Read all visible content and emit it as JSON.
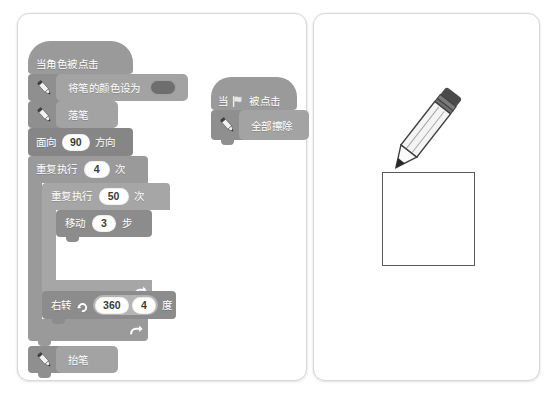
{
  "page": {
    "left_panel_name": "script-canvas-left",
    "right_panel_name": "stage-illustration-right"
  },
  "scripts": {
    "main": {
      "hat": {
        "label": "当角色被点击",
        "name": "when-sprite-clicked"
      },
      "blocks": [
        {
          "name": "set-pen-color-block",
          "label": "将笔的颜色设为",
          "icon": "pen-icon",
          "swatch": "#6e6e6e"
        },
        {
          "name": "pen-down-block",
          "label": "落笔",
          "icon": "pen-icon"
        },
        {
          "name": "point-in-direction-block",
          "label_pre": "面向",
          "value": "90",
          "label_post": "方向"
        },
        {
          "name": "repeat-outer-block",
          "label_pre": "重复执行",
          "value": "4",
          "label_post": "次",
          "loop_icon": "loop-arrow-icon"
        },
        {
          "name": "repeat-inner-block",
          "label_pre": "重复执行",
          "value": "50",
          "label_post": "次",
          "loop_icon": "loop-arrow-icon"
        },
        {
          "name": "move-steps-block",
          "label_pre": "移动",
          "value": "3",
          "label_post": "步"
        },
        {
          "name": "turn-right-block",
          "label_pre": "右转",
          "icon": "turn-right-icon",
          "value_a": "360",
          "value_b": "4",
          "label_post": "度"
        },
        {
          "name": "pen-up-block",
          "label": "抬笔",
          "icon": "pen-icon"
        }
      ]
    },
    "secondary": {
      "hat": {
        "label_pre": "当",
        "flag_icon": "green-flag-icon",
        "label_post": "被点击",
        "name": "when-flag-clicked"
      },
      "blocks": [
        {
          "name": "erase-all-block",
          "label": "全部擦除",
          "icon": "pen-icon"
        }
      ]
    }
  },
  "illustration": {
    "pencil": {
      "name": "pencil-illustration",
      "tip": "drawing"
    },
    "square": {
      "name": "drawn-square-shape"
    }
  },
  "colors": {
    "block_grey": "#9a9a9a",
    "block_grey_dark": "#8c8c8c",
    "block_grey_light": "#a6a6a6",
    "oval_white": "#ffffff",
    "swatch": "#6e6e6e",
    "sheet_border": "#d8d8d8",
    "drawing_stroke": "#5a5a5a"
  }
}
